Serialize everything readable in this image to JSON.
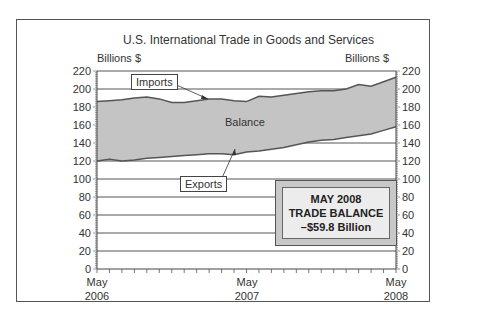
{
  "chart_data": {
    "type": "area",
    "title": "U.S. International Trade in Goods and Services",
    "ylabel_left": "Billions $",
    "ylabel_right": "Billions $",
    "ylim": [
      0,
      220
    ],
    "yticks": [
      0,
      20,
      40,
      60,
      80,
      100,
      120,
      140,
      160,
      180,
      200,
      220
    ],
    "xtick_labels": [
      {
        "line1": "May",
        "line2": "2006"
      },
      {
        "line1": "May",
        "line2": "2007"
      },
      {
        "line1": "May",
        "line2": "2008"
      }
    ],
    "x": [
      "May 2006",
      "Jun 2006",
      "Jul 2006",
      "Aug 2006",
      "Sep 2006",
      "Oct 2006",
      "Nov 2006",
      "Dec 2006",
      "Jan 2007",
      "Feb 2007",
      "Mar 2007",
      "Apr 2007",
      "May 2007",
      "Jun 2007",
      "Jul 2007",
      "Aug 2007",
      "Sep 2007",
      "Oct 2007",
      "Nov 2007",
      "Dec 2007",
      "Jan 2008",
      "Feb 2008",
      "Mar 2008",
      "Apr 2008",
      "May 2008"
    ],
    "series": [
      {
        "name": "Imports",
        "values": [
          186,
          187,
          188,
          190,
          191,
          189,
          185,
          185,
          187,
          189,
          189,
          187,
          186,
          192,
          191,
          193,
          195,
          197,
          198,
          198,
          200,
          205,
          203,
          208,
          213
        ]
      },
      {
        "name": "Exports",
        "values": [
          120,
          122,
          120,
          121,
          123,
          124,
          125,
          126,
          127,
          128,
          128,
          127,
          130,
          131,
          133,
          135,
          138,
          141,
          143,
          144,
          146,
          148,
          150,
          154,
          158
        ]
      }
    ],
    "grid": true,
    "annotations": [
      {
        "text": "Imports",
        "type": "callout"
      },
      {
        "text": "Exports",
        "type": "callout"
      },
      {
        "text": "Balance",
        "type": "area-label"
      }
    ],
    "summary_box": {
      "line1": "MAY 2008",
      "line2": "TRADE BALANCE",
      "line3": "–$59.8 Billion"
    }
  },
  "labels": {
    "title": "U.S. International Trade in Goods and Services",
    "unit_left": "Billions $",
    "unit_right": "Billions $",
    "imports": "Imports",
    "exports": "Exports",
    "balance": "Balance",
    "x0_l1": "May",
    "x0_l2": "2006",
    "x1_l1": "May",
    "x1_l2": "2007",
    "x2_l1": "May",
    "x2_l2": "2008",
    "box_l1": "MAY 2008",
    "box_l2": "TRADE BALANCE",
    "box_l3": "–$59.8 Billion"
  },
  "colors": {
    "fill": "#c4c4c4",
    "line": "#555555",
    "grid": "#555555"
  }
}
